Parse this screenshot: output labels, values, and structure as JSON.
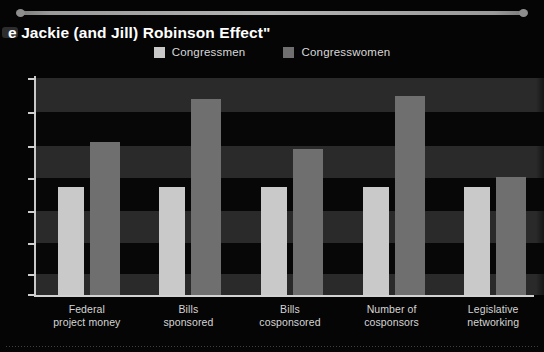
{
  "slide": {
    "title": "e Jackie (and Jill) Robinson Effect\"",
    "title_full": "The Jackie (and Jill) Robinson Effect\"",
    "divider": "top-rule"
  },
  "legend": {
    "items": [
      {
        "label": "Congressmen",
        "color": "#c9c9c9"
      },
      {
        "label": "Congresswomen",
        "color": "#6f6f6f"
      }
    ]
  },
  "colors": {
    "background": "#050505",
    "band_dark": "#2a2a2a",
    "band_black": "#070707",
    "axis": "#d2d2d2",
    "men": "#c9c9c9",
    "women": "#6f6f6f",
    "text": "#d8d8d8"
  },
  "chart_data": {
    "type": "bar",
    "xlabel": "",
    "ylabel": "",
    "ylim": [
      0,
      200
    ],
    "grid": "horizontal-bands",
    "legend_position": "top-center",
    "axis_tick_labels": [],
    "categories": [
      "Federal project money",
      "Bills sponsored",
      "Bills cosponsored",
      "Number of cosponsors",
      "Legislative networking"
    ],
    "category_lines": [
      [
        "Federal",
        "project money"
      ],
      [
        "Bills",
        "sponsored"
      ],
      [
        "Bills",
        "cosponsored"
      ],
      [
        "Number of",
        "cosponsors"
      ],
      [
        "Legislative",
        "networking"
      ]
    ],
    "series": [
      {
        "name": "Congressmen",
        "color": "#c9c9c9",
        "values": [
          100,
          100,
          100,
          100,
          100
        ]
      },
      {
        "name": "Congresswomen",
        "color": "#6f6f6f",
        "values": [
          141,
          181,
          135,
          183,
          109
        ]
      }
    ]
  }
}
